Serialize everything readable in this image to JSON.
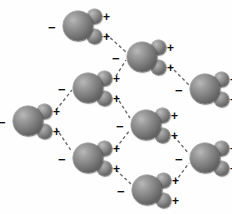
{
  "diagram": {
    "canvas": {
      "width": 232,
      "height": 214,
      "background": "#ffffff"
    },
    "atom_colors": {
      "oxygen": "#7a7a7a",
      "hydrogen": "#8f8f8f",
      "charge_label": "#111111",
      "hydrogen_bond": "#6b6b6b"
    },
    "labels": {
      "negative": "−",
      "positive": "+"
    },
    "molecules": [
      {
        "id": "m1",
        "name": "water-molecule-top",
        "x": 78,
        "y": 26
      },
      {
        "id": "m2",
        "name": "water-molecule-upper-middle",
        "x": 142,
        "y": 57
      },
      {
        "id": "m3",
        "name": "water-molecule-mid-left",
        "x": 88,
        "y": 88
      },
      {
        "id": "m4",
        "name": "water-molecule-right-upper",
        "x": 205,
        "y": 89
      },
      {
        "id": "m5",
        "name": "water-molecule-far-left",
        "x": 28,
        "y": 121
      },
      {
        "id": "m6",
        "name": "water-molecule-center",
        "x": 146,
        "y": 125
      },
      {
        "id": "m7",
        "name": "water-molecule-lower-left",
        "x": 88,
        "y": 158
      },
      {
        "id": "m8",
        "name": "water-molecule-right-lower",
        "x": 205,
        "y": 158
      },
      {
        "id": "m9",
        "name": "water-molecule-bottom",
        "x": 147,
        "y": 190
      }
    ],
    "hydrogen_bonds": [
      {
        "name": "bond-m1-m2",
        "x1": 106,
        "y1": 34,
        "x2": 126,
        "y2": 52
      },
      {
        "name": "bond-m3-m2",
        "x1": 116,
        "y1": 76,
        "x2": 126,
        "y2": 60
      },
      {
        "name": "bond-m5-m3",
        "x1": 56,
        "y1": 110,
        "x2": 72,
        "y2": 90
      },
      {
        "name": "bond-m5-m7",
        "x1": 56,
        "y1": 128,
        "x2": 72,
        "y2": 152
      },
      {
        "name": "bond-m2-m4",
        "x1": 170,
        "y1": 66,
        "x2": 189,
        "y2": 85
      },
      {
        "name": "bond-m3-m6",
        "x1": 116,
        "y1": 96,
        "x2": 130,
        "y2": 118
      },
      {
        "name": "bond-m7-m6",
        "x1": 116,
        "y1": 148,
        "x2": 130,
        "y2": 130
      },
      {
        "name": "bond-m6-m8",
        "x1": 174,
        "y1": 136,
        "x2": 189,
        "y2": 154
      },
      {
        "name": "bond-m9-m8",
        "x1": 175,
        "y1": 182,
        "x2": 189,
        "y2": 163
      },
      {
        "name": "bond-m7-m9",
        "x1": 116,
        "y1": 170,
        "x2": 131,
        "y2": 184
      }
    ]
  }
}
